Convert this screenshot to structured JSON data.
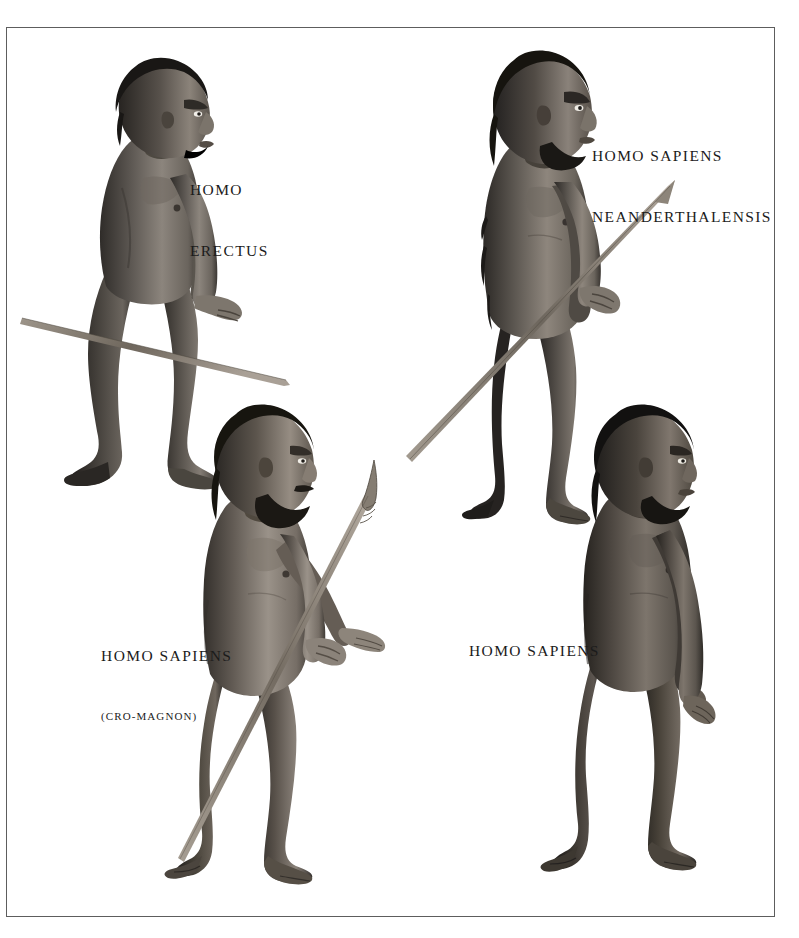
{
  "plate": {
    "title": "Human Evolution — Hominid Figures Plate",
    "background_color": "#ffffff",
    "frame_color": "#5d5d5d",
    "ink_color": "#1b1b1b",
    "width": 799,
    "height": 938
  },
  "figures": [
    {
      "id": "homo-erectus",
      "label_lines": [
        "HOMO",
        "ERECTUS"
      ],
      "sublabel": "",
      "pose": "walking left-to-right profile, facing right",
      "holds": "long wooden sharpened spear, held low across body",
      "body_hair": "heavy",
      "beard": "none",
      "skin_tone": "#6e6a66"
    },
    {
      "id": "homo-sapiens-neanderthalensis",
      "label_lines": [
        "HOMO SAPIENS",
        "NEANDERTHALENSIS"
      ],
      "sublabel": "",
      "pose": "standing profile, facing right",
      "holds": "long wooden spear angled upward in right hand",
      "body_hair": "heavy",
      "beard": "full dark beard",
      "skin_tone": "#6b6763"
    },
    {
      "id": "homo-sapiens-cro-magnon",
      "label_lines": [
        "HOMO SAPIENS"
      ],
      "sublabel": "(CRO-MAGNON)",
      "pose": "standing profile, facing right, left arm extended",
      "holds": "spear with knapped stone point, held diagonally",
      "body_hair": "light",
      "beard": "dark beard and moustache",
      "skin_tone": "#7a736c"
    },
    {
      "id": "homo-sapiens",
      "label_lines": [
        "HOMO SAPIENS"
      ],
      "sublabel": "",
      "pose": "walking profile, facing right, arms at sides",
      "holds": "nothing",
      "body_hair": "minimal",
      "beard": "short dark beard",
      "skin_tone": "#5e5953"
    }
  ]
}
